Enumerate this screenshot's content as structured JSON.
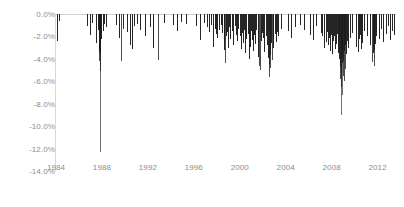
{
  "chart_data": {
    "type": "bar",
    "title": "",
    "subtitle": "",
    "xlabel": "",
    "ylabel": "",
    "orientation": "vertical-downward-spikes",
    "grid": false,
    "zero_gridline": true,
    "legend": "none",
    "xlim": [
      1984,
      2013.6
    ],
    "ylim": [
      -14.0,
      0.0
    ],
    "y_unit": "percent",
    "y_ticks": [
      0.0,
      -2.0,
      -4.0,
      -6.0,
      -8.0,
      -10.0,
      -12.0,
      -14.0
    ],
    "y_tick_labels": [
      "0.0%",
      "-2.0%",
      "-4.0%",
      "-6.0%",
      "-8.0%",
      "-10.0%",
      "-12.0%",
      "-14.0%"
    ],
    "x_ticks": [
      1984,
      1988,
      1992,
      1996,
      2000,
      2004,
      2008,
      2012
    ],
    "x_tick_labels": [
      "1984",
      "1988",
      "1992",
      "1996",
      "2000",
      "2004",
      "2008",
      "2012"
    ],
    "series_name": "Daily negative return",
    "series_color": "#1a1a1a",
    "axis_color": "#d8d8d8",
    "label_color": "#8c8c8c",
    "notable_events": [
      {
        "label": "Black Monday 1987",
        "x": 1987.8,
        "y": -12.3
      },
      {
        "label": "2008 financial crisis",
        "x": 2008.78,
        "y": -9.0
      },
      {
        "label": "2002 selloff",
        "x": 2002.55,
        "y": -5.6
      }
    ],
    "x": [
      1984.05,
      1984.3,
      1986.7,
      1986.95,
      1987.15,
      1987.45,
      1987.62,
      1987.72,
      1987.78,
      1987.8,
      1987.82,
      1987.86,
      1987.92,
      1988.05,
      1988.15,
      1988.35,
      1989.2,
      1989.45,
      1989.62,
      1989.8,
      1990.15,
      1990.4,
      1990.62,
      1990.8,
      1991.05,
      1991.35,
      1991.72,
      1992.15,
      1992.45,
      1992.85,
      1993.4,
      1994.15,
      1994.55,
      1994.9,
      1995.3,
      1996.15,
      1996.55,
      1996.85,
      1997.12,
      1997.35,
      1997.52,
      1997.68,
      1997.8,
      1997.92,
      1998.05,
      1998.2,
      1998.35,
      1998.48,
      1998.6,
      1998.65,
      1998.72,
      1998.8,
      1998.88,
      1998.95,
      1999.08,
      1999.18,
      1999.3,
      1999.42,
      1999.55,
      1999.68,
      1999.78,
      1999.88,
      2000.02,
      2000.12,
      2000.22,
      2000.3,
      2000.38,
      2000.48,
      2000.58,
      2000.68,
      2000.78,
      2000.88,
      2000.95,
      2001.05,
      2001.15,
      2001.25,
      2001.35,
      2001.45,
      2001.55,
      2001.68,
      2001.72,
      2001.82,
      2001.92,
      2002.05,
      2002.15,
      2002.28,
      2002.38,
      2002.45,
      2002.5,
      2002.55,
      2002.6,
      2002.65,
      2002.72,
      2002.78,
      2002.85,
      2002.92,
      2003.05,
      2003.15,
      2003.25,
      2003.35,
      2003.6,
      2004.2,
      2004.45,
      2004.8,
      2005.2,
      2005.6,
      2006.15,
      2006.4,
      2006.6,
      2007.05,
      2007.2,
      2007.35,
      2007.5,
      2007.6,
      2007.68,
      2007.78,
      2007.88,
      2007.95,
      2008.05,
      2008.12,
      2008.2,
      2008.28,
      2008.35,
      2008.45,
      2008.55,
      2008.62,
      2008.68,
      2008.72,
      2008.75,
      2008.78,
      2008.8,
      2008.83,
      2008.86,
      2008.9,
      2008.94,
      2008.98,
      2009.02,
      2009.06,
      2009.1,
      2009.15,
      2009.2,
      2009.28,
      2009.35,
      2009.45,
      2009.6,
      2009.75,
      2010.1,
      2010.3,
      2010.42,
      2010.5,
      2010.58,
      2010.68,
      2010.85,
      2011.1,
      2011.3,
      2011.5,
      2011.58,
      2011.62,
      2011.66,
      2011.7,
      2011.75,
      2011.82,
      2011.9,
      2012.1,
      2012.3,
      2012.5,
      2012.7,
      2012.9,
      2013.05,
      2013.25,
      2013.4
    ],
    "values": [
      -2.4,
      -0.6,
      -1.1,
      -1.9,
      -0.8,
      -2.6,
      -1.4,
      -3.4,
      -4.2,
      -12.3,
      -5.1,
      -3.6,
      -2.2,
      -1.5,
      -0.9,
      -1.2,
      -1.0,
      -2.1,
      -4.2,
      -1.3,
      -1.6,
      -2.8,
      -3.1,
      -1.1,
      -0.9,
      -1.4,
      -2.0,
      -1.2,
      -3.0,
      -4.1,
      -0.8,
      -1.0,
      -1.5,
      -0.7,
      -0.9,
      -1.1,
      -2.3,
      -0.8,
      -1.2,
      -1.6,
      -1.0,
      -2.9,
      -1.3,
      -1.8,
      -2.1,
      -1.4,
      -1.0,
      -1.7,
      -2.5,
      -3.2,
      -4.4,
      -2.0,
      -1.6,
      -3.0,
      -1.2,
      -2.2,
      -1.5,
      -2.8,
      -1.1,
      -1.9,
      -2.4,
      -1.3,
      -2.0,
      -3.1,
      -1.7,
      -2.6,
      -1.4,
      -3.5,
      -2.2,
      -1.8,
      -4.0,
      -2.9,
      -1.5,
      -2.3,
      -3.3,
      -1.9,
      -2.7,
      -1.4,
      -3.8,
      -4.6,
      -5.0,
      -2.4,
      -1.7,
      -2.1,
      -3.4,
      -2.0,
      -2.8,
      -3.9,
      -4.5,
      -5.6,
      -4.8,
      -3.7,
      -2.6,
      -4.1,
      -3.0,
      -2.2,
      -1.8,
      -2.5,
      -1.6,
      -2.0,
      -1.3,
      -1.5,
      -2.1,
      -1.2,
      -1.0,
      -1.4,
      -1.9,
      -2.3,
      -1.1,
      -1.7,
      -2.0,
      -3.0,
      -2.5,
      -1.6,
      -2.8,
      -2.1,
      -3.3,
      -1.9,
      -3.6,
      -2.4,
      -2.0,
      -3.1,
      -2.7,
      -1.8,
      -3.5,
      -2.2,
      -4.0,
      -4.7,
      -5.8,
      -9.0,
      -6.5,
      -5.2,
      -7.2,
      -4.4,
      -3.8,
      -5.5,
      -4.2,
      -6.0,
      -3.3,
      -4.9,
      -2.8,
      -3.6,
      -2.4,
      -3.0,
      -2.1,
      -1.7,
      -2.9,
      -3.4,
      -2.2,
      -1.9,
      -3.1,
      -2.6,
      -1.5,
      -2.0,
      -2.8,
      -4.3,
      -3.5,
      -2.4,
      -4.6,
      -3.2,
      -2.7,
      -2.0,
      -1.6,
      -2.2,
      -1.3,
      -2.5,
      -1.8,
      -1.1,
      -2.3,
      -1.5,
      -1.9
    ]
  }
}
